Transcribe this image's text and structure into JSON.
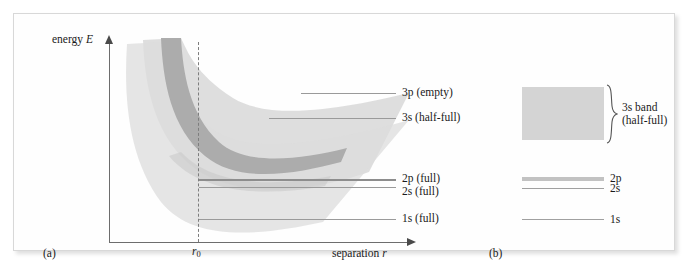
{
  "figure": {
    "top_cut_text": "",
    "panel_a": {
      "caption": "(a)",
      "y_axis_label_text": "energy",
      "y_axis_label_symbol": "E",
      "x_axis_label_text": "separation",
      "x_axis_label_symbol": "r",
      "equilibrium_marker": "r",
      "equilibrium_marker_subscript": "0",
      "levels": [
        {
          "id": "3p",
          "label": "3p (empty)"
        },
        {
          "id": "3s",
          "label": "3s (half-full)"
        },
        {
          "id": "2p",
          "label": "2p (full)"
        },
        {
          "id": "2s",
          "label": "2s (full)"
        },
        {
          "id": "1s",
          "label": "1s (full)"
        }
      ]
    },
    "panel_b": {
      "caption": "(b)",
      "band_label_line1": "3s band",
      "band_label_line2": "(half-full)",
      "levels": [
        {
          "id": "2p",
          "label": "2p"
        },
        {
          "id": "2s",
          "label": "2s"
        },
        {
          "id": "1s",
          "label": "1s"
        }
      ]
    },
    "colors": {
      "band_light": "#d8d8d8",
      "band_mid": "#c9c9c9",
      "band_dark": "#a9a9a9",
      "level_line": "#9a9a9a",
      "axis": "#6d6d6d",
      "panel_background": "#fefefe",
      "panel_border": "#d8d8d8",
      "text": "#1a1a1a"
    }
  }
}
